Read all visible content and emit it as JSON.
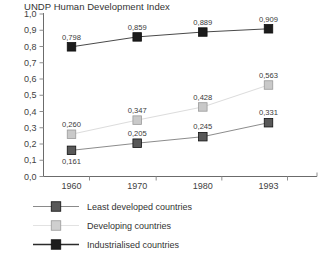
{
  "chart_data": {
    "type": "line",
    "title": "UNDP Human Development Index",
    "xlabel": "",
    "ylabel": "",
    "x": [
      "1960",
      "1970",
      "1980",
      "1993"
    ],
    "categories": [
      "1960",
      "1970",
      "1980",
      "1993"
    ],
    "ylim": [
      0.0,
      1.0
    ],
    "ytick_labels": [
      "0,0",
      "0,1",
      "0,2",
      "0,3",
      "0,4",
      "0,5",
      "0,6",
      "0,7",
      "0,8",
      "0,9",
      "1,0"
    ],
    "ytick_values": [
      0.0,
      0.1,
      0.2,
      0.3,
      0.4,
      0.5,
      0.6,
      0.7,
      0.8,
      0.9,
      1.0
    ],
    "xtick_labels": [
      "1960",
      "1970",
      "1980",
      "1993"
    ],
    "grid": false,
    "legend_position": "below-left",
    "decimal_separator": ",",
    "series": [
      {
        "name": "Least developed countries",
        "color": "#585858",
        "marker": "square",
        "values": [
          0.161,
          0.205,
          0.245,
          0.331
        ],
        "labels": [
          "0,161",
          "0,205",
          "0,245",
          "0,331"
        ],
        "label_positions": [
          "below",
          "above",
          "above",
          "above"
        ]
      },
      {
        "name": "Developing countries",
        "color": "#c9c9c9",
        "marker": "square",
        "values": [
          0.26,
          0.347,
          0.428,
          0.563
        ],
        "labels": [
          "0,260",
          "0,347",
          "0,428",
          "0,563"
        ],
        "label_positions": [
          "above",
          "above",
          "above",
          "above"
        ]
      },
      {
        "name": "Industrialised countries",
        "color": "#1c1c1c",
        "marker": "square",
        "values": [
          0.798,
          0.859,
          0.889,
          0.909
        ],
        "labels": [
          "0,798",
          "0,859",
          "0,889",
          "0,909"
        ],
        "label_positions": [
          "above",
          "above",
          "above",
          "above"
        ]
      }
    ]
  },
  "legend": {
    "items": [
      {
        "label": "Least developed countries",
        "color": "#585858",
        "line_color": "#8a8a8a",
        "line_width": 1
      },
      {
        "label": "Developing countries",
        "color": "#cfcfcf",
        "line_color": "#e2e2e2",
        "line_width": 1
      },
      {
        "label": "Industrialised countries",
        "color": "#1c1c1c",
        "line_color": "#2b2b2b",
        "line_width": 1.6
      }
    ]
  },
  "axes": {
    "axis_color": "#6b6b6b",
    "tick_color": "#8f8f8f"
  }
}
